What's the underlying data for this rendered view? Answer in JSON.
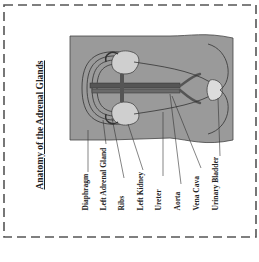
{
  "title": "Anatomy of the Adrenal Glands",
  "colors": {
    "border": "#555555",
    "body_fill": "#9a9a9a",
    "organ_fill": "#cfcfcf",
    "vessel_fill": "#555555",
    "line": "#333333"
  },
  "labels": [
    {
      "id": "diaphragm",
      "text": "Diaphragm"
    },
    {
      "id": "left-adrenal-gland",
      "text": "Left Adrenal Gland"
    },
    {
      "id": "ribs",
      "text": "Ribs"
    },
    {
      "id": "left-kidney",
      "text": "Left Kidney"
    },
    {
      "id": "ureter",
      "text": "Ureter"
    },
    {
      "id": "aorta",
      "text": "Aorta"
    },
    {
      "id": "vena-cava",
      "text": "Vena Cava"
    },
    {
      "id": "urinary-bladder",
      "text": "Urinary Bladder"
    }
  ]
}
